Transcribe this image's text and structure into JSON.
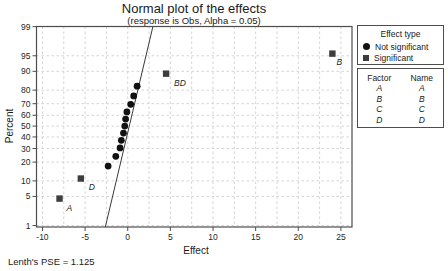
{
  "title": "Normal plot of the effects",
  "subtitle": "(response is Obs, Alpha = 0.05)",
  "footer_note": "Lenth's PSE = 1.125",
  "axes": {
    "x_label": "Effect",
    "y_label": "Percent"
  },
  "legend": {
    "effect_type": {
      "title": "Effect type",
      "items": [
        {
          "marker": "circle-marker-icon",
          "label": "Not significant"
        },
        {
          "marker": "square-marker-icon",
          "label": "Significant"
        }
      ]
    },
    "factor_table": {
      "headers": [
        "Factor",
        "Name"
      ],
      "rows": [
        [
          "A",
          "A"
        ],
        [
          "B",
          "B"
        ],
        [
          "C",
          "C"
        ],
        [
          "D",
          "D"
        ]
      ]
    }
  },
  "colors": {
    "not_significant": "#111111",
    "significant": "#3d3d3d",
    "fit_line": "#3a3a3a",
    "grid": "#d4d4d4",
    "frame": "#4d4d4d",
    "tick_text": "#262626"
  },
  "chart_data": {
    "type": "scatter",
    "title": "Normal plot of the effects",
    "subtitle": "(response is Obs, Alpha = 0.05)",
    "xlabel": "Effect",
    "ylabel": "Percent",
    "y_scale": "normal-probability",
    "grid": true,
    "x_ticks": [
      -10,
      -5,
      0,
      5,
      10,
      15,
      20,
      25
    ],
    "x_minor_grid_step": 2.5,
    "xlim": [
      -10.7,
      26.3
    ],
    "y_ticks_percent": [
      1,
      5,
      10,
      20,
      30,
      40,
      50,
      60,
      70,
      80,
      90,
      95,
      99
    ],
    "zlim": [
      -2.36,
      2.33
    ],
    "alpha": 0.05,
    "lenths_pse": 1.125,
    "points": [
      {
        "label": "A",
        "effect": -8.0,
        "percent": 4.5,
        "significant": true,
        "label_dx": 7,
        "label_dy": 12
      },
      {
        "label": "D",
        "effect": -5.5,
        "percent": 11.0,
        "significant": true,
        "label_dx": 8,
        "label_dy": 11
      },
      {
        "effect": -2.3,
        "percent": 17.5,
        "significant": false
      },
      {
        "effect": -1.4,
        "percent": 24.0,
        "significant": false
      },
      {
        "effect": -0.9,
        "percent": 30.5,
        "significant": false
      },
      {
        "effect": -0.75,
        "percent": 37.0,
        "significant": false
      },
      {
        "effect": -0.5,
        "percent": 43.5,
        "significant": false
      },
      {
        "effect": -0.35,
        "percent": 50.0,
        "significant": false
      },
      {
        "effect": -0.25,
        "percent": 56.5,
        "significant": false
      },
      {
        "effect": -0.1,
        "percent": 63.0,
        "significant": false
      },
      {
        "effect": 0.35,
        "percent": 69.5,
        "significant": false
      },
      {
        "effect": 0.7,
        "percent": 76.0,
        "significant": false
      },
      {
        "effect": 1.1,
        "percent": 82.5,
        "significant": false
      },
      {
        "label": "BD",
        "effect": 4.5,
        "percent": 89.0,
        "significant": true,
        "label_dx": 8,
        "label_dy": 12
      },
      {
        "label": "B",
        "effect": 24.0,
        "percent": 95.5,
        "significant": true,
        "label_dx": 4,
        "label_dy": 11
      }
    ],
    "fit_line": {
      "slope_per_z": 1.19,
      "intercept": 0.18
    }
  }
}
